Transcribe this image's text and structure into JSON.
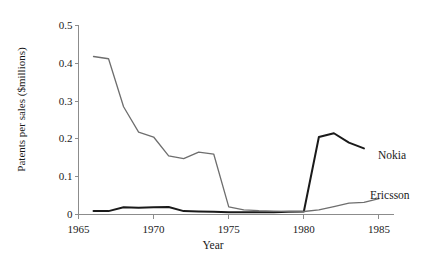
{
  "chart_data": {
    "type": "line",
    "title": "",
    "xlabel": "Year",
    "ylabel": "Patents per sales ($millions)",
    "xlim": [
      1965,
      1986
    ],
    "ylim": [
      0,
      0.5
    ],
    "xticks": [
      1965,
      1970,
      1975,
      1980,
      1985
    ],
    "xtick_labels": [
      "1965",
      "1970",
      "1975",
      "1980",
      "1985"
    ],
    "yticks": [
      0,
      0.1,
      0.2,
      0.3,
      0.4,
      0.5
    ],
    "ytick_labels": [
      "0",
      "0.1",
      "0.2",
      "0.3",
      "0.4",
      "0.5"
    ],
    "grid": false,
    "legend_position": "inline-right-annotations",
    "series": [
      {
        "name": "Nokia",
        "color": "#1a1a1a",
        "width": 2.0,
        "x": [
          1966,
          1967,
          1968,
          1969,
          1970,
          1971,
          1972,
          1973,
          1974,
          1975,
          1976,
          1977,
          1978,
          1979,
          1980,
          1981,
          1982,
          1983,
          1984
        ],
        "values": [
          0.009,
          0.009,
          0.019,
          0.018,
          0.019,
          0.02,
          0.009,
          0.008,
          0.007,
          0.006,
          0.006,
          0.006,
          0.006,
          0.007,
          0.008,
          0.205,
          0.215,
          0.19,
          0.175
        ]
      },
      {
        "name": "Ericsson",
        "color": "#6e6e6e",
        "width": 1.3,
        "x": [
          1966,
          1967,
          1968,
          1969,
          1970,
          1971,
          1972,
          1973,
          1974,
          1975,
          1976,
          1977,
          1978,
          1979,
          1980,
          1981,
          1982,
          1983,
          1984,
          1985
        ],
        "values": [
          0.418,
          0.412,
          0.285,
          0.218,
          0.205,
          0.155,
          0.148,
          0.165,
          0.16,
          0.02,
          0.012,
          0.01,
          0.009,
          0.008,
          0.008,
          0.012,
          0.021,
          0.03,
          0.032,
          0.042
        ]
      }
    ],
    "annotations": [
      {
        "text": "Nokia",
        "x_px": 378,
        "y_px": 150
      },
      {
        "text": "Ericsson",
        "x_px": 370,
        "y_px": 190
      }
    ]
  },
  "axes": {
    "y_axis_label": "Patents per sales ($millions)",
    "x_axis_label": "Year"
  }
}
